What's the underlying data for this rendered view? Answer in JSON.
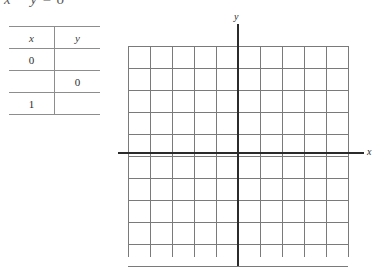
{
  "equation": {
    "text": "x − y = 6"
  },
  "table": {
    "headers": {
      "x": "x",
      "y": "y"
    },
    "rows": [
      {
        "x": "0",
        "y": ""
      },
      {
        "x": "",
        "y": "0"
      },
      {
        "x": "1",
        "y": ""
      }
    ]
  },
  "graph": {
    "x_axis_label": "x",
    "y_axis_label": "y",
    "grid": {
      "columns": 10,
      "rows": 10,
      "vertical_lines": 11,
      "horizontal_lines": 11,
      "cell_size": 22,
      "left": 128,
      "top": 46,
      "right": 348,
      "bottom": 257,
      "x_axis_y": 153,
      "y_axis_x": 238
    },
    "colors": {
      "grid_line": "#7a7a7a",
      "axis_line": "#2b2b2b",
      "table_rule": "#8d8d8d",
      "text": "#2b2b2b",
      "background": "#ffffff"
    }
  }
}
